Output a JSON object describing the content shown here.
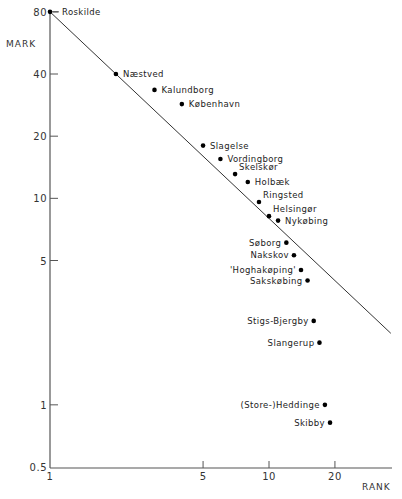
{
  "chart_data": {
    "type": "scatter",
    "title": "",
    "xlabel": "RANK",
    "ylabel": "MARK",
    "xscale": "log",
    "yscale": "log",
    "xlim": [
      1,
      37
    ],
    "ylim": [
      0.5,
      80
    ],
    "xticks": [
      1,
      5,
      10,
      20
    ],
    "xtick_labels": [
      "1",
      "5",
      "10",
      "20"
    ],
    "yticks": [
      0.5,
      1,
      5,
      10,
      20,
      40,
      80
    ],
    "ytick_labels": [
      "0.5",
      "1",
      "5",
      "10",
      "20",
      "40",
      "80"
    ],
    "grid": false,
    "legend": "none",
    "reference_line": {
      "description": "rank-size line mark = 80 / rank",
      "from": [
        1,
        80
      ],
      "to": [
        36,
        2.22
      ]
    },
    "points": [
      {
        "name": "Roskilde",
        "rank": 1,
        "mark": 80,
        "label_side": "right"
      },
      {
        "name": "Næstved",
        "rank": 2,
        "mark": 40,
        "label_side": "right"
      },
      {
        "name": "Kalundborg",
        "rank": 3,
        "mark": 33.5,
        "label_side": "right"
      },
      {
        "name": "København",
        "rank": 4,
        "mark": 28.6,
        "label_side": "right"
      },
      {
        "name": "Slagelse",
        "rank": 5,
        "mark": 18,
        "label_side": "right"
      },
      {
        "name": "Vordingborg",
        "rank": 6,
        "mark": 15.5,
        "label_side": "right"
      },
      {
        "name": "Skelskør",
        "rank": 7,
        "mark": 13.1,
        "label_side": "upper-right"
      },
      {
        "name": "Holbæk",
        "rank": 8,
        "mark": 12,
        "label_side": "right"
      },
      {
        "name": "Ringsted",
        "rank": 9,
        "mark": 9.6,
        "label_side": "upper-right"
      },
      {
        "name": "Helsingør",
        "rank": 10,
        "mark": 8.2,
        "label_side": "upper-right"
      },
      {
        "name": "Nykøbing",
        "rank": 11,
        "mark": 7.8,
        "label_side": "right"
      },
      {
        "name": "Søborg",
        "rank": 12,
        "mark": 6.1,
        "label_side": "left"
      },
      {
        "name": "Nakskov",
        "rank": 13,
        "mark": 5.3,
        "label_side": "left"
      },
      {
        "name": "'Hoghakøping'",
        "rank": 14,
        "mark": 4.5,
        "label_side": "left"
      },
      {
        "name": "Sakskøbing",
        "rank": 15,
        "mark": 4.0,
        "label_side": "left"
      },
      {
        "name": "Stigs-Bjergby",
        "rank": 16,
        "mark": 2.55,
        "label_side": "left"
      },
      {
        "name": "Slangerup",
        "rank": 17,
        "mark": 2.0,
        "label_side": "left"
      },
      {
        "name": "(Store-)Heddinge",
        "rank": 18,
        "mark": 1.0,
        "label_side": "left"
      },
      {
        "name": "Skibby",
        "rank": 19,
        "mark": 0.82,
        "label_side": "left"
      }
    ]
  }
}
